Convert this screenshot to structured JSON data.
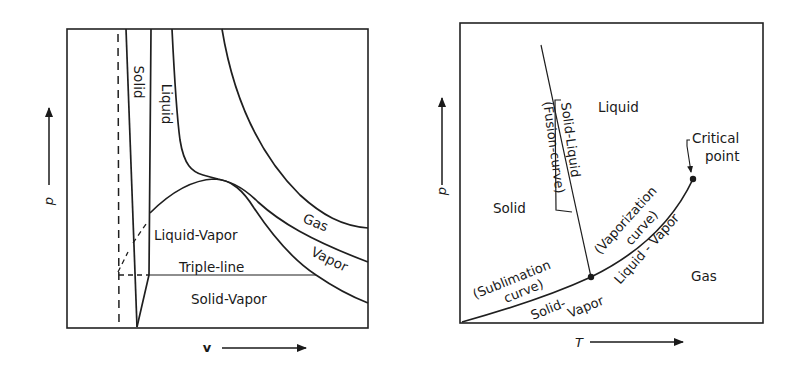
{
  "figure": {
    "left_panel": {
      "title": "p-v phase diagram",
      "x_axis_label": "v",
      "y_axis_label": "p",
      "regions": {
        "solid": "Solid",
        "liquid": "Liquid",
        "gas": "Gas",
        "vapor": "Vapor",
        "liquid_vapor": "Liquid-Vapor",
        "triple_line": "Triple-line",
        "solid_vapor": "Solid-Vapor"
      }
    },
    "right_panel": {
      "title": "p-T phase diagram",
      "x_axis_label": "T",
      "y_axis_label": "p",
      "regions": {
        "solid": "Solid",
        "liquid": "Liquid",
        "gas": "Gas"
      },
      "curves": {
        "fusion_name": "Solid-Liquid",
        "fusion_paren": "(Fusion-curve)",
        "vaporization_name": "Liquid - Vapor",
        "vaporization_paren": "(Vaporization",
        "vaporization_paren2": "curve)",
        "sublimation_paren": "(Sublimation",
        "sublimation_paren2": "curve)",
        "sublimation_name1": "Solid-",
        "sublimation_name2": "Vapor"
      },
      "annotations": {
        "critical_point_line1": "Critical",
        "critical_point_line2": "point"
      }
    }
  }
}
